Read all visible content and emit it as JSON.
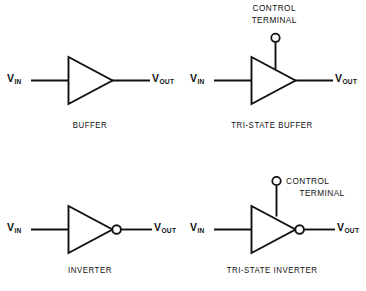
{
  "figure": {
    "background_color": "#ffffff",
    "line_color": "#111111",
    "width": 366,
    "height": 291
  },
  "labels": {
    "v_in_letter": "V",
    "v_in_sub": "IN",
    "v_out_letter": "V",
    "v_out_sub": "OUT",
    "control_line1": "CONTROL",
    "control_line2": "TERMINAL"
  },
  "gates": [
    {
      "id": "buffer",
      "caption": "BUFFER",
      "has_bubble": false,
      "has_control_terminal": false,
      "input_label_letter": "V",
      "input_label_sub": "IN",
      "output_label_letter": "V",
      "output_label_sub": "OUT"
    },
    {
      "id": "tri-state-buffer",
      "caption": "TRI-STATE BUFFER",
      "has_bubble": false,
      "has_control_terminal": true,
      "control_label_line1": "CONTROL",
      "control_label_line2": "TERMINAL",
      "input_label_letter": "V",
      "input_label_sub": "IN",
      "output_label_letter": "V",
      "output_label_sub": "OUT"
    },
    {
      "id": "inverter",
      "caption": "INVERTER",
      "has_bubble": true,
      "has_control_terminal": false,
      "input_label_letter": "V",
      "input_label_sub": "IN",
      "output_label_letter": "V",
      "output_label_sub": "OUT"
    },
    {
      "id": "tri-state-inverter",
      "caption": "TRI-STATE INVERTER",
      "has_bubble": true,
      "has_control_terminal": true,
      "control_label_line1": "CONTROL",
      "control_label_line2": "TERMINAL",
      "input_label_letter": "V",
      "input_label_sub": "IN",
      "output_label_letter": "V",
      "output_label_sub": "OUT"
    }
  ]
}
